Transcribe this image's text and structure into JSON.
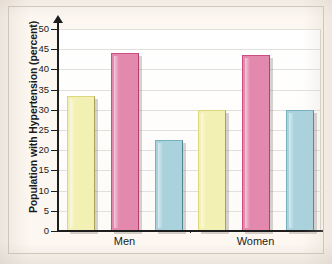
{
  "figure": {
    "background_color": "#fdf6ee",
    "plot_background_color": "#ffffff",
    "frame_color": "#cfc8bd"
  },
  "chart_data": {
    "type": "bar",
    "title": "",
    "xlabel": "",
    "ylabel": "Population with Hypertension (percent)",
    "categories": [
      "Men",
      "Women"
    ],
    "series": [
      {
        "name": "series-1",
        "values": [
          33.5,
          30.0
        ],
        "color": "#f3f0b4"
      },
      {
        "name": "series-2",
        "values": [
          44.0,
          43.5
        ],
        "color": "#e389ad"
      },
      {
        "name": "series-3",
        "values": [
          22.5,
          30.0
        ],
        "color": "#a9d2dd"
      }
    ],
    "ylim": [
      0,
      50
    ],
    "yticks": [
      0,
      5,
      10,
      15,
      20,
      25,
      30,
      35,
      40,
      45,
      50
    ],
    "ytick_labels": [
      "0",
      "5",
      "10",
      "15",
      "20",
      "25",
      "30",
      "35",
      "40",
      "45",
      "50"
    ],
    "grid": true,
    "grid_axis": "y",
    "legend": false,
    "legend_position": "none",
    "axis_arrow_y": true
  }
}
